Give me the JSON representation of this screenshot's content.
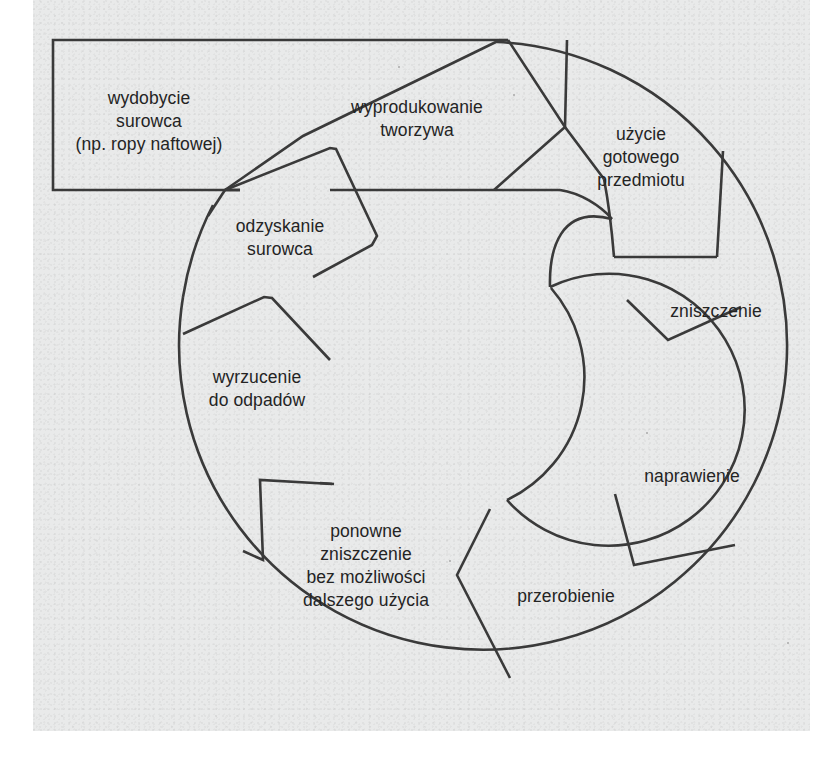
{
  "figure": {
    "type": "cycle-diagram",
    "language": "pl",
    "background_color": "#e9eaea",
    "stroke_color": "#3a3a3a",
    "text_color": "#242424"
  },
  "stages": [
    {
      "id": "wydobycie",
      "shape": "rectangle",
      "lines": [
        "wydobycie",
        "surowca",
        "(np. ropy naftowej)"
      ],
      "label_x": 149,
      "label_y": 122
    },
    {
      "id": "wyprodukowanie",
      "shape": "chevron",
      "lines": [
        "wyprodukowanie",
        "tworzywa"
      ],
      "label_x": 417,
      "label_y": 119
    },
    {
      "id": "uzycie",
      "shape": "chevron-sector",
      "lines": [
        "użycie",
        "gotowego",
        "przedmiotu"
      ],
      "label_x": 641,
      "label_y": 158
    },
    {
      "id": "zniszczenie",
      "shape": "ring-sector",
      "lines": [
        "zniszczenie"
      ],
      "label_x": 716,
      "label_y": 312
    },
    {
      "id": "naprawienie",
      "shape": "ring-sector",
      "lines": [
        "naprawienie"
      ],
      "label_x": 692,
      "label_y": 477
    },
    {
      "id": "przerobienie",
      "shape": "ring-sector",
      "lines": [
        "przerobienie"
      ],
      "label_x": 566,
      "label_y": 597
    },
    {
      "id": "ponowne-zniszczenie",
      "shape": "ring-sector",
      "lines": [
        "ponowne",
        "zniszczenie",
        "bez możliwości",
        "dalszego użycia"
      ],
      "label_x": 366,
      "label_y": 566
    },
    {
      "id": "wyrzucenie",
      "shape": "ring-sector",
      "lines": [
        "wyrzucenie",
        "do odpadów"
      ],
      "label_x": 257,
      "label_y": 389
    },
    {
      "id": "odzyskanie",
      "shape": "chevron-sector",
      "lines": [
        "odzyskanie",
        "surowca"
      ],
      "label_x": 280,
      "label_y": 238
    }
  ],
  "geometry": {
    "outer_circle": {
      "cx": 455,
      "cy": 375,
      "r": 304
    },
    "inner_circle": {
      "cx": 455,
      "cy": 375,
      "r": 136
    },
    "top_rect": {
      "x": 53,
      "y": 40,
      "w": 450,
      "h": 150
    }
  }
}
